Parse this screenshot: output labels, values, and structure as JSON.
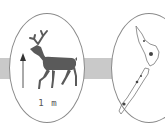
{
  "figure": {
    "left_panel": {
      "subject": "deer-silhouette",
      "scale_arrow": "up-arrow",
      "scale_label": "1 m"
    },
    "right_panel": {
      "subject": "new-zealand-map"
    },
    "connector": "gray-band"
  },
  "colors": {
    "band": "#c9c9c9",
    "deer": "#5a5a5a",
    "outline": "#8a8a8a",
    "map_marks": "#444444"
  }
}
